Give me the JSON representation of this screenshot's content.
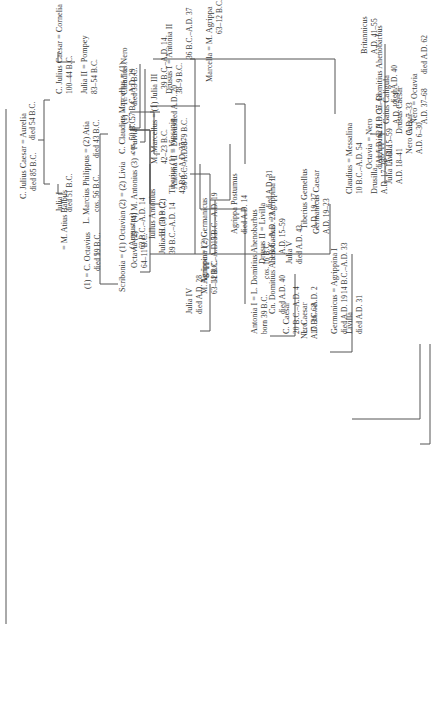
{
  "diagram": {
    "type": "family-tree",
    "orientation": "rotated-90-counterclockwise",
    "people": [
      {
        "id": "cjc_elder",
        "name": "C. Julius Caesar = Aurelia",
        "dates": "died 85 B.C."
      },
      {
        "id": "aurelia",
        "name": "",
        "dates": "died 54 B.C."
      },
      {
        "id": "cjc",
        "name": "C. Julius Caesar = Cornelia",
        "dates": "100–44 B.C."
      },
      {
        "id": "julia1",
        "name": "Julia I",
        "dates": "died 51 B.C."
      },
      {
        "id": "balbus",
        "name": "= M. Atius Balbus",
        "dates": ""
      },
      {
        "id": "julia2",
        "name": "Julia II = Pompey",
        "dates": "83–54 B.C."
      },
      {
        "id": "philippus",
        "name": "L. Marcius Philippus = (2) Atia",
        "dates": "cos. 56 B.C."
      },
      {
        "id": "atia",
        "name": "",
        "dates": "died 43 B.C."
      },
      {
        "id": "octavius",
        "name": "(1) = C. Octavius",
        "dates": "died 59 B.C."
      },
      {
        "id": "marcellus_c",
        "name": "C. Claudius Marcellus = (1)",
        "dates": "cos. 50 B.C."
      },
      {
        "id": "octavia",
        "name": "Octavia (2) = (4) M. Antonius (3) = Fulvia",
        "dates": "64–11 B.C."
      },
      {
        "id": "iullus",
        "name": "Iullus Antonius",
        "dates": "cos. 10 B.C."
      },
      {
        "id": "scribonia",
        "name": "Scribonia = (1) Octavian (2) = (2) Livia",
        "dates": ""
      },
      {
        "id": "octavian",
        "name": "(Augustus)",
        "dates": "63 B.C.–A.D. 14"
      },
      {
        "id": "livia",
        "name": "",
        "dates": "57 B.C.–A.D. 29"
      },
      {
        "id": "tcnero",
        "name": "(1) = Ti. Claudius Nero",
        "dates": "died 33 B.C."
      },
      {
        "id": "marcellus_m",
        "name": "M. Marcellus = (1) Julia III",
        "dates": "42–23 B.C."
      },
      {
        "id": "julia3_dates",
        "name": "",
        "dates": "39 B.C.–A.D. 14"
      },
      {
        "id": "marcella",
        "name": "Marcella = M. Agrippa",
        "dates": "63–12 B.C."
      },
      {
        "id": "antonia2",
        "name": "Antonia II = Drusus I",
        "dates": "36 B.C.–A.D. 37"
      },
      {
        "id": "drusus1_dates",
        "name": "",
        "dates": "38–9 B.C."
      },
      {
        "id": "agrippa",
        "name": "M. Agrippa = (2)",
        "dates": "63–12 B.C."
      },
      {
        "id": "julia3",
        "name": "Julia III (3) = (2)",
        "dates": "39 B.C.–A.D. 14"
      },
      {
        "id": "tiberius",
        "name": "Tiberius (1) = Vipsania",
        "dates": "42 B.C.–A.D. 37"
      },
      {
        "id": "vipsania",
        "name": "",
        "dates": "died A.D. 20"
      },
      {
        "id": "drusus1b",
        "name": "Drusus I = Antonia II",
        "dates": "38–9 B.C."
      },
      {
        "id": "antonia2b",
        "name": "",
        "dates": "36 B.C.–A.D. 37"
      },
      {
        "id": "antonia1",
        "name": "Antonia I = L. Domitius Ahenobarbus",
        "dates": "born 39 B.C."
      },
      {
        "id": "ldomitius",
        "name": "",
        "dates": "cos. 16 B.C."
      },
      {
        "id": "ccaesar",
        "name": "C. Caesar",
        "dates": "20 B.C.–A.D. 4"
      },
      {
        "id": "lcaesar",
        "name": "L. Caesar",
        "dates": "17 B.C.–A.D. 2"
      },
      {
        "id": "julia4",
        "name": "Julia IV",
        "dates": "died A.D. 28"
      },
      {
        "id": "agrippina1",
        "name": "Agrippina I = Germanicus",
        "dates": "14 B.C.–A.D. 33"
      },
      {
        "id": "germanicus_dates",
        "name": "",
        "dates": "15 B.C.–A.D. 19"
      },
      {
        "id": "agrpostumus",
        "name": "Agrippa Postumus",
        "dates": "died A.D. 14"
      },
      {
        "id": "drusus2",
        "name": "Drusus II = Livilla",
        "dates": "13 B.C.–A.D. 23"
      },
      {
        "id": "livilla_dates",
        "name": "",
        "dates": "died A.D. 31"
      },
      {
        "id": "germcaesar",
        "name": "Germanicus Caesar",
        "dates": "A.D. 19–23"
      },
      {
        "id": "julia5",
        "name": "Julia V",
        "dates": "died A.D. 43"
      },
      {
        "id": "tgemellus",
        "name": "Tiberius Gemellus",
        "dates": "A.D. 19–37"
      },
      {
        "id": "cndomitius",
        "name": "Cn. Domitius Ahenobarbus = Agrippina II",
        "dates": "died A.D. 40"
      },
      {
        "id": "agrippina2_dates",
        "name": "",
        "dates": "A.D. 15–59"
      },
      {
        "id": "nero_a",
        "name": "Nero",
        "dates": "A.D. 36–68"
      },
      {
        "id": "germanicus2",
        "name": "Germanicus = Agrippina I",
        "dates": "died A.D. 19"
      },
      {
        "id": "agrippina1b",
        "name": "",
        "dates": "14 B.C.–A.D. 33"
      },
      {
        "id": "livilla",
        "name": "Livilla",
        "dates": "died A.D. 31"
      },
      {
        "id": "claudius",
        "name": "Claudius = Messalina",
        "dates": "10 B.C.–A.D. 54"
      },
      {
        "id": "octavia2",
        "name": "Octavia = Nero",
        "dates": "died A.D. 62"
      },
      {
        "id": "nero_b_dates",
        "name": "",
        "dates": "A.D. 37–68"
      },
      {
        "id": "britannicus",
        "name": "Britannicus",
        "dates": "A.D. 41–55"
      },
      {
        "id": "nerocaesar",
        "name": "Nero Caesar",
        "dates": "A.D. 6–30"
      },
      {
        "id": "drususcaesar",
        "name": "Drusus Caesar",
        "dates": "A.D. 7–33"
      },
      {
        "id": "caligula",
        "name": "Gaius Caligula",
        "dates": "A.D. 12–41"
      },
      {
        "id": "agrippina2",
        "name": "Agrippina II = Cn. Domitius Ahenobarbus",
        "dates": "A.D. 15–59"
      },
      {
        "id": "cndomitius2_dates",
        "name": "",
        "dates": "died A.D. 40"
      },
      {
        "id": "drusilla",
        "name": "Drusilla",
        "dates": "A.D. 17–38"
      },
      {
        "id": "julialivilla",
        "name": "Julia Livilla",
        "dates": "A.D. 18–41"
      },
      {
        "id": "nero_c",
        "name": "Nero = Octavia",
        "dates": "A.D. 37–68"
      },
      {
        "id": "octavia3_dates",
        "name": "",
        "dates": "died A.D. 62"
      }
    ]
  }
}
